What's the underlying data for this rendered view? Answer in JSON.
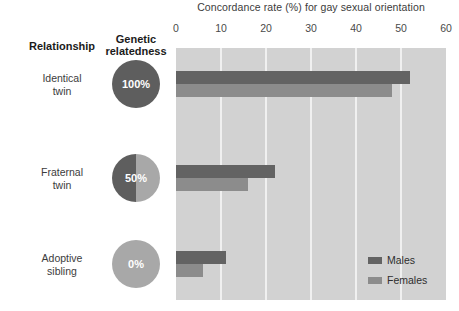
{
  "chart_data": {
    "type": "bar",
    "orientation": "horizontal",
    "title": "",
    "xlabel": "Concordance rate (%) for gay sexual orientation",
    "ylabel": "",
    "xlim": [
      0,
      60
    ],
    "xticks": [
      0,
      10,
      20,
      30,
      40,
      50,
      60
    ],
    "grid": true,
    "legend_position": "bottom-right",
    "categories": [
      "Identical twin",
      "Fraternal twin",
      "Adoptive sibling"
    ],
    "series": [
      {
        "name": "Males",
        "color": "#636363",
        "values": [
          52,
          22,
          11
        ]
      },
      {
        "name": "Females",
        "color": "#8c8c8c",
        "values": [
          48,
          16,
          6
        ]
      }
    ],
    "annotations": {
      "genetic_relatedness": [
        "100%",
        "50%",
        "0%"
      ]
    }
  },
  "headers": {
    "relationship": "Relationship",
    "relatedness_line1": "Genetic",
    "relatedness_line2": "relatedness"
  },
  "axis": {
    "title": "Concordance rate (%) for gay sexual orientation",
    "ticks": [
      "0",
      "10",
      "20",
      "30",
      "40",
      "50",
      "60"
    ]
  },
  "rows": [
    {
      "label_line1": "Identical",
      "label_line2": "twin",
      "relatedness": "100%",
      "males": 52,
      "females": 48
    },
    {
      "label_line1": "Fraternal",
      "label_line2": "twin",
      "relatedness": "50%",
      "males": 22,
      "females": 16
    },
    {
      "label_line1": "Adoptive",
      "label_line2": "sibling",
      "relatedness": "0%",
      "males": 11,
      "females": 6
    }
  ],
  "legend": {
    "males": "Males",
    "females": "Females"
  },
  "colors": {
    "males": "#636363",
    "females": "#8c8c8c",
    "plot_background": "#d2d2d2",
    "gridline": "#f0f0f0",
    "pie_dark": "#5e5e5e",
    "pie_light": "#a8a8a8"
  }
}
